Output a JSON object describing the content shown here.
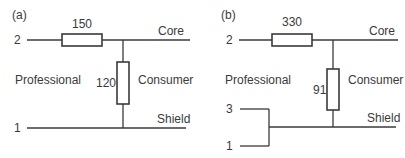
{
  "panels": [
    {
      "tag": "(a)",
      "series_resistor": "150",
      "shunt_resistor": "120",
      "terminal_top": "2",
      "terminal_bottom": "1",
      "side_left": "Professional",
      "side_right": "Consumer",
      "line_top": "Core",
      "line_bottom": "Shield"
    },
    {
      "tag": "(b)",
      "series_resistor": "330",
      "shunt_resistor": "91",
      "terminal_top": "2",
      "terminal_mid": "3",
      "terminal_bottom": "1",
      "side_left": "Professional",
      "side_right": "Consumer",
      "line_top": "Core",
      "line_bottom": "Shield"
    }
  ],
  "colors": {
    "line": "#3a3a3a",
    "text": "#3a3a3a"
  }
}
